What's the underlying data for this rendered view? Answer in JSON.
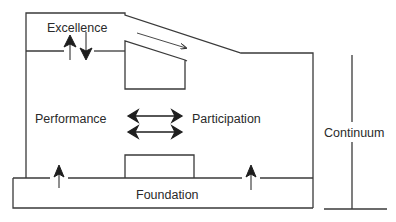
{
  "diagram": {
    "type": "sport development model",
    "labels": {
      "excellence": "Excellence",
      "performance": "Performance",
      "participation": "Participation",
      "foundation": "Foundation",
      "continuum": "Continuum"
    },
    "colors": {
      "line": "#3a3a3a",
      "text": "#2a2a2a",
      "background": "#ffffff"
    }
  }
}
